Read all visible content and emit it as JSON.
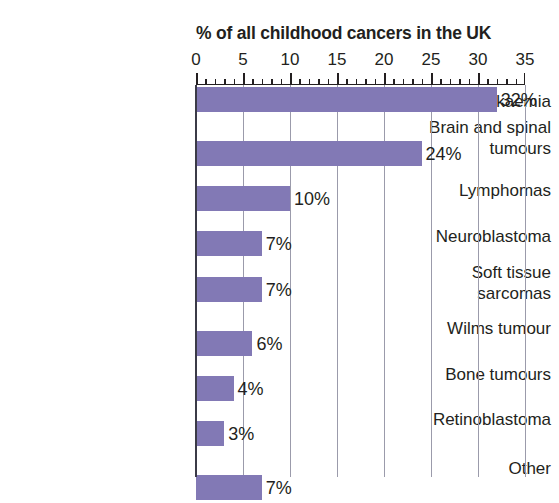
{
  "chart_data": {
    "type": "bar",
    "orientation": "horizontal",
    "title": "% of all childhood cancers in the UK",
    "xlabel": "",
    "ylabel": "",
    "xlim": [
      0,
      35
    ],
    "x_major_step": 5,
    "x_minor_step": 1,
    "grid": "vertical-major-only",
    "legend": "none",
    "bar_color": "#8279b5",
    "text_color": "#231f20",
    "gridline_color": "#9b9bab",
    "axis_color": "#3b3b47",
    "background": "#ffffff",
    "tick_labels": [
      "0",
      "5",
      "10",
      "15",
      "20",
      "25",
      "30",
      "35"
    ],
    "tick_values": [
      0,
      5,
      10,
      15,
      20,
      25,
      30,
      35
    ],
    "categories": [
      "Leukaemia",
      "Brain and spinal\ntumours",
      "Lymphomas",
      "Neuroblastoma",
      "Soft tissue\nsarcomas",
      "Wilms tumour",
      "Bone tumours",
      "Retinoblastoma",
      "Other"
    ],
    "values": [
      32,
      24,
      10,
      7,
      7,
      6,
      4,
      3,
      7
    ],
    "value_labels": [
      "32%",
      "24%",
      "10%",
      "7%",
      "7%",
      "6%",
      "4%",
      "3%",
      "7%"
    ],
    "bars": [
      {
        "category": "Leukaemia",
        "value": 32,
        "label": "32%"
      },
      {
        "category": "Brain and spinal tumours",
        "value": 24,
        "label": "24%"
      },
      {
        "category": "Lymphomas",
        "value": 10,
        "label": "10%"
      },
      {
        "category": "Neuroblastoma",
        "value": 7,
        "label": "7%"
      },
      {
        "category": "Soft tissue sarcomas",
        "value": 7,
        "label": "7%"
      },
      {
        "category": "Wilms tumour",
        "value": 6,
        "label": "6%"
      },
      {
        "category": "Bone tumours",
        "value": 4,
        "label": "4%"
      },
      {
        "category": "Retinoblastoma",
        "value": 3,
        "label": "3%"
      },
      {
        "category": "Other",
        "value": 7,
        "label": "7%"
      }
    ]
  }
}
